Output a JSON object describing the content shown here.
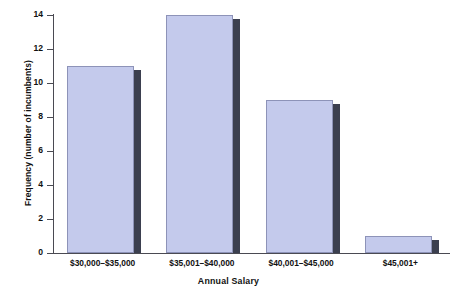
{
  "chart_data": {
    "type": "bar",
    "title": "",
    "subtitle": "",
    "xlabel": "Annual Salary",
    "ylabel": "Frequency (number of incumbents)",
    "categories": [
      "$30,000–$35,000",
      "$35,001–$40,000",
      "$40,001–$45,000",
      "$45,001+"
    ],
    "values": [
      11,
      14,
      9,
      1
    ],
    "ylim": [
      0,
      14
    ],
    "yticks": [
      0,
      2,
      4,
      6,
      8,
      10,
      12,
      14
    ],
    "ytick_labels": [
      "0",
      "2",
      "4",
      "6",
      "8",
      "10",
      "12",
      "14"
    ],
    "grid": false,
    "legend": false,
    "legend_position": "none",
    "bar_fill_color": "#c4caec",
    "bar_edge_color": "#8d93b8",
    "bar_shadow_color": "#3b3f4f",
    "axis_color": "#4a4a52",
    "background_color": "#ffffff"
  },
  "caption": {
    "text": ""
  }
}
